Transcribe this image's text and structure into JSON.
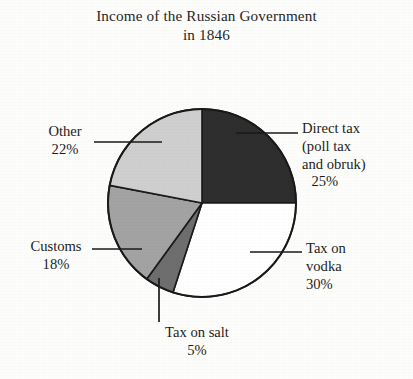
{
  "title": {
    "line1": "Income of the Russian Government",
    "line2": "in 1846"
  },
  "chart_data": {
    "type": "pie",
    "title": "Income of the Russian Government in 1846",
    "subtitle": "in 1846",
    "xlabel": "",
    "ylabel": "",
    "legend": "none",
    "grid": false,
    "units": "percent",
    "start_angle_deg": 0,
    "direction": "clockwise",
    "categories": [
      "Direct tax (poll tax and obruk)",
      "Tax on vodka",
      "Tax on salt",
      "Customs",
      "Other"
    ],
    "values": [
      25,
      30,
      5,
      18,
      22
    ],
    "colors": [
      "#2e2e2e",
      "#ffffff",
      "#6e6e6e",
      "#a3a3a3",
      "#cfcfcf"
    ],
    "slices": [
      {
        "name": "direct-tax",
        "label_lines": [
          "Direct tax",
          "(poll tax",
          "and obruk)"
        ],
        "percent_text": "25%",
        "value": 25,
        "color": "#2e2e2e"
      },
      {
        "name": "tax-on-vodka",
        "label_lines": [
          "Tax on",
          "vodka"
        ],
        "percent_text": "30%",
        "value": 30,
        "color": "#ffffff"
      },
      {
        "name": "tax-on-salt",
        "label_lines": [
          "Tax on salt"
        ],
        "percent_text": "5%",
        "value": 5,
        "color": "#6e6e6e"
      },
      {
        "name": "customs",
        "label_lines": [
          "Customs"
        ],
        "percent_text": "18%",
        "value": 18,
        "color": "#a3a3a3"
      },
      {
        "name": "other",
        "label_lines": [
          "Other"
        ],
        "percent_text": "22%",
        "value": 22,
        "color": "#cfcfcf"
      }
    ]
  },
  "labels": {
    "direct_tax": {
      "l1": "Direct tax",
      "l2": "(poll tax",
      "l3": "and obruk)",
      "pct": "25%"
    },
    "vodka": {
      "l1": "Tax on",
      "l2": "vodka",
      "pct": "30%"
    },
    "salt": {
      "l1": "Tax on salt",
      "pct": "5%"
    },
    "customs": {
      "l1": "Customs",
      "pct": "18%"
    },
    "other": {
      "l1": "Other",
      "pct": "22%"
    }
  }
}
